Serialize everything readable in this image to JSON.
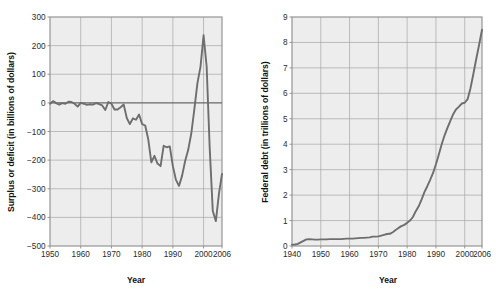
{
  "figure": {
    "background_color": "#ffffff",
    "plot_background_color": "#ededed",
    "grid_color": "#9a9a9a",
    "frame_color": "#8c8c8c",
    "line_color": "#6e6e6e",
    "text_color": "#1a1a1a"
  },
  "chart_data": [
    {
      "type": "line",
      "title": "",
      "xlabel": "Year",
      "ylabel": "Surplus or deficit (in billions of dollars)",
      "xlim": [
        1950,
        2006
      ],
      "ylim": [
        -500,
        300
      ],
      "xticks": [
        1950,
        1960,
        1970,
        1980,
        1990,
        2000,
        2006
      ],
      "xtick_labels": [
        "1950",
        "1960",
        "1970",
        "1980",
        "1990",
        "2000",
        "2006"
      ],
      "yticks": [
        -500,
        -400,
        -300,
        -200,
        -100,
        0,
        100,
        200,
        300
      ],
      "ytick_labels": [
        "-500",
        "-400",
        "-300",
        "-200",
        "-100",
        "0",
        "100",
        "200",
        "300"
      ],
      "grid": true,
      "legend": "none",
      "x": [
        1950,
        1951,
        1952,
        1953,
        1954,
        1955,
        1956,
        1957,
        1958,
        1959,
        1960,
        1961,
        1962,
        1963,
        1964,
        1965,
        1966,
        1967,
        1968,
        1969,
        1970,
        1971,
        1972,
        1973,
        1974,
        1975,
        1976,
        1977,
        1978,
        1979,
        1980,
        1981,
        1982,
        1983,
        1984,
        1985,
        1986,
        1987,
        1988,
        1989,
        1990,
        1991,
        1992,
        1993,
        1994,
        1995,
        1996,
        1997,
        1998,
        1999,
        2000,
        2001,
        2002,
        2003,
        2004,
        2005,
        2006
      ],
      "values": [
        -3,
        6,
        -1,
        -6,
        -1,
        -3,
        4,
        3,
        -3,
        -13,
        0,
        -3,
        -7,
        -5,
        -6,
        -1,
        -4,
        -9,
        -25,
        3,
        -3,
        -23,
        -23,
        -15,
        -6,
        -53,
        -74,
        -54,
        -59,
        -41,
        -74,
        -79,
        -128,
        -208,
        -185,
        -212,
        -221,
        -150,
        -155,
        -152,
        -221,
        -269,
        -290,
        -255,
        -203,
        -164,
        -107,
        -22,
        69,
        126,
        236,
        128,
        -158,
        -378,
        -413,
        -318,
        -248
      ]
    },
    {
      "type": "line",
      "title": "",
      "xlabel": "Year",
      "ylabel": "Federal debt (in trillions of dollars)",
      "xlim": [
        1940,
        2006
      ],
      "ylim": [
        0,
        9
      ],
      "xticks": [
        1940,
        1950,
        1960,
        1970,
        1980,
        1990,
        2000,
        2006
      ],
      "xtick_labels": [
        "1940",
        "1950",
        "1960",
        "1970",
        "1980",
        "1990",
        "2000",
        "2006"
      ],
      "yticks": [
        0,
        1,
        2,
        3,
        4,
        5,
        6,
        7,
        8,
        9
      ],
      "ytick_labels": [
        "0",
        "1",
        "2",
        "3",
        "4",
        "5",
        "6",
        "7",
        "8",
        "9"
      ],
      "grid": true,
      "legend": "none",
      "x": [
        1940,
        1941,
        1942,
        1943,
        1944,
        1945,
        1946,
        1947,
        1948,
        1949,
        1950,
        1951,
        1952,
        1953,
        1954,
        1955,
        1956,
        1957,
        1958,
        1959,
        1960,
        1961,
        1962,
        1963,
        1964,
        1965,
        1966,
        1967,
        1968,
        1969,
        1970,
        1971,
        1972,
        1973,
        1974,
        1975,
        1976,
        1977,
        1978,
        1979,
        1980,
        1981,
        1982,
        1983,
        1984,
        1985,
        1986,
        1987,
        1988,
        1989,
        1990,
        1991,
        1992,
        1993,
        1994,
        1995,
        1996,
        1997,
        1998,
        1999,
        2000,
        2001,
        2002,
        2003,
        2004,
        2005,
        2006
      ],
      "values": [
        0.05,
        0.06,
        0.08,
        0.14,
        0.2,
        0.26,
        0.27,
        0.26,
        0.25,
        0.25,
        0.26,
        0.26,
        0.26,
        0.27,
        0.27,
        0.27,
        0.27,
        0.27,
        0.28,
        0.29,
        0.29,
        0.29,
        0.3,
        0.31,
        0.32,
        0.32,
        0.33,
        0.34,
        0.37,
        0.37,
        0.38,
        0.41,
        0.44,
        0.47,
        0.48,
        0.54,
        0.63,
        0.71,
        0.78,
        0.83,
        0.91,
        1.0,
        1.14,
        1.37,
        1.56,
        1.82,
        2.12,
        2.35,
        2.6,
        2.87,
        3.21,
        3.6,
        4.0,
        4.35,
        4.64,
        4.92,
        5.18,
        5.37,
        5.48,
        5.6,
        5.63,
        5.77,
        6.2,
        6.76,
        7.35,
        7.91,
        8.5
      ]
    }
  ]
}
